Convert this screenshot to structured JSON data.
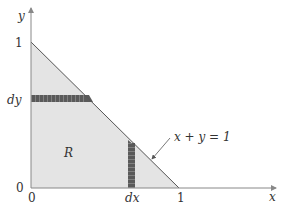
{
  "diagram": {
    "region_label": "R",
    "line_label": "x + y = 1",
    "axes": {
      "x_label": "x",
      "y_label": "y"
    },
    "ticks": {
      "x_origin": "0",
      "y_origin": "0",
      "x_one": "1",
      "y_one": "1",
      "dx": "dx",
      "dy": "dy"
    },
    "colors": {
      "region_fill": "#e4e4e4",
      "strip_fill": "#5a5a5a",
      "axis": "#888888",
      "line": "#555555"
    }
  }
}
